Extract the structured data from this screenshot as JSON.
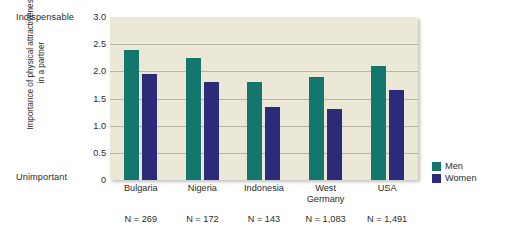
{
  "chart_data": {
    "type": "bar",
    "title": "",
    "xlabel": "",
    "ylabel": "Importance of physical attractiveness in a partner",
    "ylim": [
      0,
      3.0
    ],
    "grid": true,
    "legend_position": "right",
    "categories": [
      "Bulgaria",
      "Nigeria",
      "Indonesia",
      "West Germany",
      "USA"
    ],
    "series": [
      {
        "name": "Men",
        "color": "#14776e",
        "values": [
          2.4,
          2.25,
          1.8,
          1.9,
          2.1
        ]
      },
      {
        "name": "Women",
        "color": "#2b2b7a",
        "values": [
          1.95,
          1.8,
          1.35,
          1.3,
          1.65
        ]
      }
    ],
    "tick_labels": [
      "3.0",
      "2.5",
      "2.0",
      "1.5",
      "1.0",
      "0.5",
      "0"
    ],
    "tick_values": [
      3.0,
      2.5,
      2.0,
      1.5,
      1.0,
      0.5,
      0
    ],
    "axis_endpoint_top": "Indispensable",
    "axis_endpoint_bottom": "Unimportant",
    "annotations": [
      "N = 269",
      "N = 172",
      "N = 143",
      "N = 1,083",
      "N = 1,491"
    ],
    "sample_sizes": [
      269,
      172,
      143,
      1083,
      1491
    ],
    "plot_background": "#ece8d8",
    "gridline_color": "#b8b5a4"
  },
  "axis": {
    "endpoint_top": "Indispensable",
    "endpoint_bottom": "Unimportant",
    "y_title": "Importance of physical attractiveness in a partner",
    "ticks": [
      "3.0",
      "2.5",
      "2.0",
      "1.5",
      "1.0",
      "0.5",
      "0"
    ]
  },
  "categories": [
    {
      "label": "Bulgaria",
      "sample": "N = 269"
    },
    {
      "label": "Nigeria",
      "sample": "N = 172"
    },
    {
      "label": "Indonesia",
      "sample": "N = 143"
    },
    {
      "label": "West Germany",
      "sample": "N = 1,083"
    },
    {
      "label": "USA",
      "sample": "N = 1,491"
    }
  ],
  "legend": [
    {
      "label": "Men",
      "color": "#14776e"
    },
    {
      "label": "Women",
      "color": "#2b2b7a"
    }
  ]
}
